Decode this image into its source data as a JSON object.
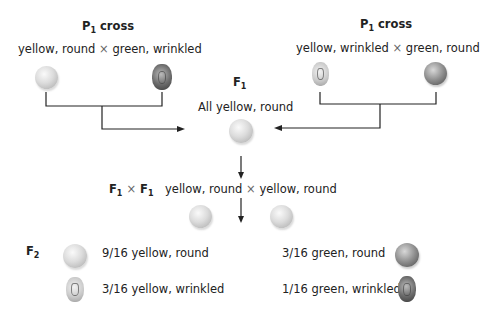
{
  "left_cross": {
    "title": "P",
    "sub": "1",
    "title_rest": " cross",
    "parent_a": "yellow, round",
    "times": "×",
    "parent_b": "green, wrinkled"
  },
  "right_cross": {
    "title": "P",
    "sub": "1",
    "title_rest": " cross",
    "parent_a": "yellow, wrinkled",
    "times": "×",
    "parent_b": "green, round"
  },
  "f1": {
    "label": "F",
    "sub": "1",
    "desc": "All yellow, round"
  },
  "f1_cross": {
    "label_a": "F",
    "sub_a": "1",
    "times": "×",
    "label_b": "F",
    "sub_b": "1",
    "parent_a": "yellow, round",
    "times2": "×",
    "parent_b": "yellow, round"
  },
  "f2": {
    "label": "F",
    "sub": "2",
    "results": [
      {
        "ratio_text": "9/16 yellow, round",
        "pea": "yellow-round"
      },
      {
        "ratio_text": "3/16 yellow, wrinkled",
        "pea": "yellow-wrinkled"
      },
      {
        "ratio_text": "3/16 green, round",
        "pea": "green-round"
      },
      {
        "ratio_text": "1/16 green, wrinkled",
        "pea": "green-wrinkled"
      }
    ]
  }
}
